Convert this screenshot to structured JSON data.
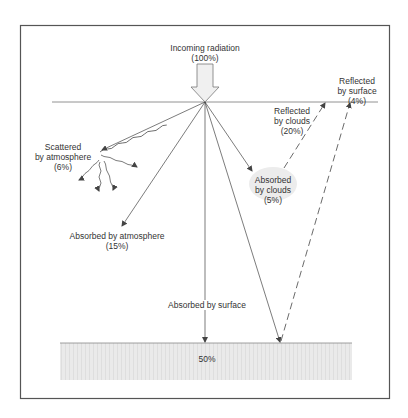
{
  "diagram": {
    "colors": {
      "frame": "#555555",
      "line": "#444444",
      "ground_fill": "#e6e6e6",
      "cloud_fill": "#ececec",
      "arrow_fill": "#f0f0f0"
    },
    "labels": {
      "incoming": {
        "line1": "Incoming radiation",
        "line2": "(100%)"
      },
      "scattered": {
        "line1": "Scattered",
        "line2": "by atmosphere",
        "line3": "(6%)"
      },
      "absorbed_atmosphere": {
        "line1": "Absorbed by atmosphere",
        "line2": "(15%)"
      },
      "absorbed_clouds": {
        "line1": "Absorbed",
        "line2": "by clouds",
        "line3": "(5%)"
      },
      "reflected_clouds": {
        "line1": "Reflected",
        "line2": "by clouds",
        "line3": "(20%)"
      },
      "reflected_surface": {
        "line1": "Reflected",
        "line2": "by surface",
        "line3": "(4%)"
      },
      "absorbed_surface": {
        "line1": "Absorbed by surface"
      },
      "ground_value": "50%"
    }
  }
}
